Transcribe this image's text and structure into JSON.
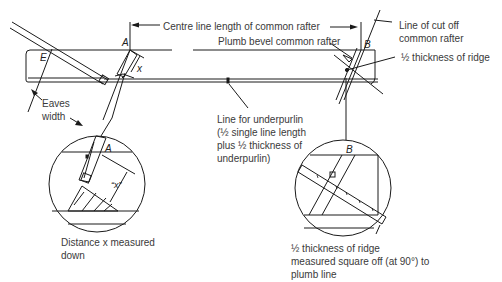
{
  "diagram": {
    "type": "technical-drawing",
    "colors": {
      "line": "#1a1a1a",
      "text": "#3a3a3a",
      "background": "#ffffff"
    }
  },
  "points": {
    "A": "A",
    "B": "B",
    "E": "E",
    "x": "x",
    "A_detail": "A",
    "x_detail": "“x”",
    "B_detail": "B"
  },
  "labels": {
    "centre_line": "Centre line length of common rafter",
    "plumb_bevel": "Plumb bevel common rafter",
    "cut_off_line": [
      "Line of cut off",
      "common rafter"
    ],
    "half_ridge": "½ thickness of ridge",
    "eaves_width": [
      "Eaves",
      "width"
    ],
    "underpurlin": [
      "Line for underpurlin",
      "(½ single line length",
      "plus ½ thickness of",
      "underpurlin)"
    ],
    "distance_x": [
      "Distance x measured",
      "down"
    ],
    "half_ridge_detail": [
      "½ thickness of ridge",
      "measured square off (at 90°) to",
      "plumb line"
    ]
  }
}
